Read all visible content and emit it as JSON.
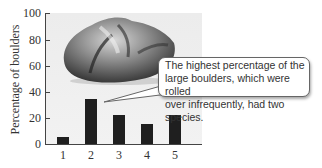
{
  "chart_data": {
    "type": "bar",
    "title": "",
    "xlabel": "",
    "ylabel": "Percentage of boulders",
    "categories": [
      "1",
      "2",
      "3",
      "4",
      "5"
    ],
    "values": [
      5,
      34,
      22,
      15,
      22
    ],
    "ylim": [
      0,
      100
    ],
    "yticks": [
      0,
      20,
      40,
      60,
      80,
      100
    ],
    "grid": false,
    "legend": null,
    "annotations": [
      {
        "text": "The highest percentage of the large boulders, which were rolled over infrequently, had two species.",
        "points_to": "2"
      }
    ],
    "image": "boulder-photo"
  },
  "axis": {
    "ylabel": "Percentage of boulders",
    "yticks": [
      "0",
      "20",
      "40",
      "60",
      "80",
      "100"
    ],
    "xticks": [
      "1",
      "2",
      "3",
      "4",
      "5"
    ]
  },
  "callout": {
    "line1": "The highest percentage of the",
    "line2": "large boulders, which were rolled",
    "line3": "over infrequently, had two species."
  }
}
